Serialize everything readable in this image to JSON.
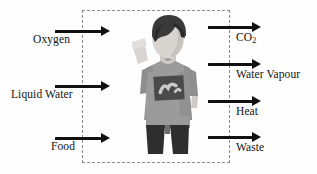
{
  "diagram": {
    "boundary": {
      "name": "system-boundary",
      "style": "dashed",
      "color": "#8a8a8a"
    },
    "inputs": [
      {
        "label": "Oxygen",
        "arrow_y": 30,
        "label_x": 33,
        "label_y": 34,
        "shaft_x": 55,
        "shaft_w": 46
      },
      {
        "label": "Liquid Water",
        "arrow_y": 85,
        "label_x": 12,
        "label_y": 89,
        "shaft_x": 55,
        "shaft_w": 46
      },
      {
        "label": "Food",
        "arrow_y": 137,
        "label_x": 51,
        "label_y": 141,
        "shaft_x": 55,
        "shaft_w": 46
      }
    ],
    "outputs": [
      {
        "label": "CO",
        "sub": "2",
        "arrow_y": 26,
        "label_x": 236,
        "label_y": 32,
        "shaft_x": 208,
        "shaft_w": 44
      },
      {
        "label": "Water Vapour",
        "sub": "",
        "arrow_y": 63,
        "label_x": 236,
        "label_y": 69,
        "shaft_x": 208,
        "shaft_w": 44
      },
      {
        "label": "Heat",
        "sub": "",
        "arrow_y": 100,
        "label_x": 236,
        "label_y": 106,
        "shaft_x": 208,
        "shaft_w": 44
      },
      {
        "label": "Waste",
        "sub": "",
        "arrow_y": 136,
        "label_x": 236,
        "label_y": 142,
        "shaft_x": 208,
        "shaft_w": 44
      }
    ],
    "figure": {
      "name": "human-figure",
      "description": "Person with raised arm wearing grey t-shirt with dark graphic print and dark shorts",
      "colors": {
        "hair": "#3a3a3a",
        "skin": "#d8d4d0",
        "shirt": "#9b9b9b",
        "shirt_graphic": "#4a4a4a",
        "shirt_graphic_detail": "#c9c9c9",
        "shorts": "#2e2e2e"
      }
    },
    "colors": {
      "background": "#fefefe",
      "arrow": "#111111",
      "text": "#111111",
      "boundary": "#8a8a8a"
    }
  }
}
